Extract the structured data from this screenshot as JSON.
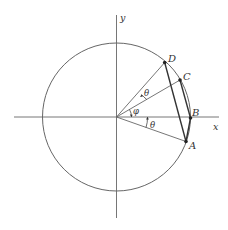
{
  "diagram": {
    "type": "unit-circle-geometry",
    "axes": {
      "x_label": "x",
      "y_label": "y"
    },
    "circle": {
      "cx": 116.5,
      "cy": 117,
      "r": 74
    },
    "points": [
      {
        "id": "D",
        "label": "D",
        "x": 164.7,
        "y": 62.5
      },
      {
        "id": "C",
        "label": "C",
        "x": 180,
        "y": 80
      },
      {
        "id": "B",
        "label": "B",
        "x": 190.5,
        "y": 118
      },
      {
        "id": "A",
        "label": "A",
        "x": 186,
        "y": 141.5
      }
    ],
    "angles": [
      {
        "id": "theta-top",
        "label": "θ",
        "between": [
          "OC",
          "OD"
        ]
      },
      {
        "id": "phi",
        "label": "φ",
        "between": [
          "x-axis",
          "OC"
        ]
      },
      {
        "id": "theta-bottom",
        "label": "θ",
        "between": [
          "OA",
          "x-axis"
        ]
      }
    ],
    "chords": [
      [
        "D",
        "A"
      ],
      [
        "C",
        "B"
      ],
      [
        "B",
        "A"
      ]
    ],
    "colors": {
      "stroke": "#555555",
      "chord": "#333333",
      "point": "#222222"
    }
  }
}
